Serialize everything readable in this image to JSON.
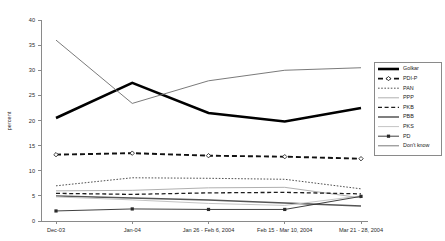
{
  "chart_data": {
    "type": "line",
    "title": "",
    "xlabel": "",
    "ylabel": "percent",
    "ylim": [
      0,
      40
    ],
    "yticks": [
      0,
      5,
      10,
      15,
      20,
      25,
      30,
      35,
      40
    ],
    "grid": false,
    "legend_position": "right",
    "categories": [
      "Dec-03",
      "Jan-04",
      "Jan 26 - Feb 6, 2004",
      "Feb 15 - Mar 10, 2004",
      "Mar 21 - 28, 2004"
    ],
    "series": [
      {
        "name": "Golkar",
        "values": [
          20.5,
          27.5,
          21.5,
          19.8,
          22.5
        ],
        "color": "#000000",
        "style": "solid-thick",
        "stroke_width": 2.6,
        "dash": "none",
        "marker": "none"
      },
      {
        "name": "PDI-P",
        "values": [
          13.2,
          13.5,
          13.0,
          12.8,
          12.4
        ],
        "color": "#111111",
        "style": "dashed-thick",
        "stroke_width": 1.9,
        "dash": "5,3",
        "marker": "diamond"
      },
      {
        "name": "PAN",
        "values": [
          7.0,
          8.6,
          8.5,
          8.3,
          6.4
        ],
        "color": "#3d3d3d",
        "style": "dotted",
        "stroke_width": 0.9,
        "dash": "1.6,1.6",
        "marker": "none"
      },
      {
        "name": "PPP",
        "values": [
          6.0,
          6.1,
          6.6,
          6.7,
          4.6
        ],
        "color": "#b0b0b0",
        "style": "solid-thin",
        "stroke_width": 1.0,
        "dash": "none",
        "marker": "none"
      },
      {
        "name": "PKB",
        "values": [
          5.5,
          5.3,
          5.6,
          5.7,
          5.4
        ],
        "color": "#1d1d1d",
        "style": "dashed-thin",
        "stroke_width": 1.3,
        "dash": "4,2.6",
        "marker": "none"
      },
      {
        "name": "PBB",
        "values": [
          5.0,
          4.6,
          4.2,
          3.6,
          3.0
        ],
        "color": "#555555",
        "style": "solid-medium",
        "stroke_width": 1.5,
        "dash": "none",
        "marker": "none"
      },
      {
        "name": "PKS",
        "values": [
          4.8,
          4.2,
          3.5,
          3.1,
          5.0
        ],
        "color": "#c4c4c4",
        "style": "solid-thin",
        "stroke_width": 1.0,
        "dash": "none",
        "marker": "none"
      },
      {
        "name": "PD",
        "values": [
          2.0,
          2.4,
          2.3,
          2.3,
          4.9
        ],
        "color": "#2a2a2a",
        "style": "solid-marker",
        "stroke_width": 0.9,
        "dash": "none",
        "marker": "square"
      },
      {
        "name": "Don't know",
        "values": [
          36.0,
          23.4,
          27.9,
          30.0,
          30.5
        ],
        "color": "#6b6b6b",
        "style": "solid-thin",
        "stroke_width": 0.9,
        "dash": "none",
        "marker": "none"
      }
    ]
  },
  "axis": {
    "y_title": "percent"
  }
}
